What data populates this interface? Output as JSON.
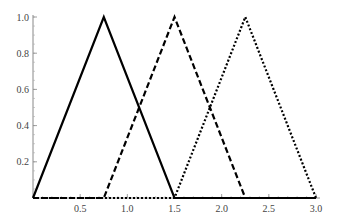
{
  "chart_data": {
    "type": "line",
    "title": "",
    "xlabel": "",
    "ylabel": "",
    "xlim": [
      0,
      3.0
    ],
    "ylim": [
      0,
      1.0
    ],
    "grid": false,
    "legend": null,
    "x_ticks": [
      "0.5",
      "1.0",
      "1.5",
      "2.0",
      "2.5",
      "3.0"
    ],
    "y_ticks": [
      "0.2",
      "0.4",
      "0.6",
      "0.8",
      "1.0"
    ],
    "series": [
      {
        "name": "solid",
        "style": "solid",
        "x": [
          0,
          0.75,
          1.5,
          3.0
        ],
        "y": [
          0,
          1,
          0,
          0
        ]
      },
      {
        "name": "dashed",
        "style": "dashed",
        "x": [
          0,
          0.75,
          1.5,
          2.25,
          3.0
        ],
        "y": [
          0,
          0,
          1,
          0,
          0
        ]
      },
      {
        "name": "dotted",
        "style": "dotted",
        "x": [
          0,
          1.5,
          2.25,
          3.0
        ],
        "y": [
          0,
          0,
          1,
          0
        ]
      }
    ]
  }
}
